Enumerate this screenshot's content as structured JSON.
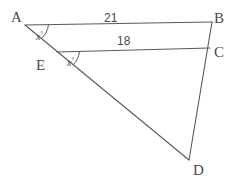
{
  "figure": {
    "type": "geometry-diagram",
    "background_color": "#ffffff",
    "stroke_color": "#5a5a5a",
    "text_color": "#4a4a4a",
    "vertices": [
      {
        "id": "A",
        "label": "A",
        "x": 25,
        "y": 25
      },
      {
        "id": "B",
        "label": "B",
        "x": 212,
        "y": 22
      },
      {
        "id": "C",
        "label": "C",
        "x": 210,
        "y": 48
      },
      {
        "id": "D",
        "label": "D",
        "x": 189,
        "y": 160
      },
      {
        "id": "E",
        "label": "E",
        "x": 57,
        "y": 52
      }
    ],
    "segments": [
      {
        "id": "AB",
        "from": "A",
        "to": "B"
      },
      {
        "id": "EC",
        "from": "E",
        "to": "C"
      },
      {
        "id": "AD",
        "from": "A",
        "to": "D"
      },
      {
        "id": "BD",
        "from": "B",
        "to": "D"
      }
    ],
    "side_labels": [
      {
        "id": "AB-length",
        "text": "21",
        "segment": "AB"
      },
      {
        "id": "EC-length",
        "text": "18",
        "segment": "EC"
      }
    ],
    "angle_marks": [
      {
        "id": "angle-A",
        "vertex": "A",
        "text": "x",
        "unit": "°"
      },
      {
        "id": "angle-E",
        "vertex": "E",
        "text": "x",
        "unit": "°"
      }
    ]
  }
}
